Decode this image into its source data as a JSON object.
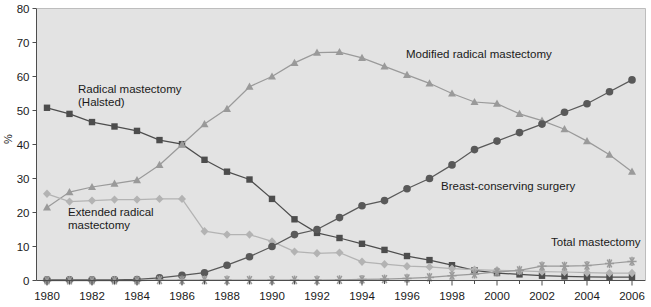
{
  "chart_data": {
    "type": "line",
    "title": "",
    "subtitle": "",
    "xlabel": "",
    "ylabel": "%",
    "xlim": [
      1980,
      2006
    ],
    "ylim": [
      0,
      80
    ],
    "ytick_step": 10,
    "yticks": [
      0,
      10,
      20,
      30,
      40,
      50,
      60,
      70,
      80
    ],
    "xticks": [
      1980,
      1982,
      1984,
      1986,
      1988,
      1990,
      1992,
      1994,
      1996,
      1998,
      2000,
      2002,
      2004,
      2006
    ],
    "xtick_labels": [
      "1980",
      "1982",
      "1984",
      "1986",
      "1988",
      "1990",
      "1992",
      "1994",
      "1996",
      "1998",
      "2000",
      "2002",
      "2004",
      "2006"
    ],
    "ytick_labels": [
      "0",
      "10",
      "20",
      "30",
      "40",
      "50",
      "60",
      "70",
      "80"
    ],
    "x": [
      1980,
      1981,
      1982,
      1983,
      1984,
      1985,
      1986,
      1987,
      1988,
      1989,
      1990,
      1991,
      1992,
      1993,
      1994,
      1995,
      1996,
      1997,
      1998,
      1999,
      2000,
      2001,
      2002,
      2003,
      2004,
      2005,
      2006
    ],
    "grid": false,
    "legend_position": "inline-annotations",
    "plot_background": "#e3e3e3",
    "series": [
      {
        "name": "Radical mastectomy (Halsted)",
        "marker": "square",
        "color": "#4d4d4d",
        "label_text": "Radical mastectomy\n(Halsted)",
        "values": [
          50.8,
          49.0,
          46.6,
          45.3,
          44.0,
          41.3,
          40.1,
          35.5,
          32.0,
          29.7,
          24.0,
          18.0,
          14.0,
          12.5,
          10.8,
          9.0,
          7.2,
          6.0,
          4.5,
          3.0,
          2.2,
          1.8,
          1.4,
          1.2,
          1.1,
          1.0,
          1.0
        ]
      },
      {
        "name": "Modified radical mastectomy",
        "marker": "triangle",
        "color": "#9a9a9a",
        "label_text": "Modified radical mastectomy",
        "values": [
          21.5,
          26.0,
          27.5,
          28.5,
          29.5,
          34.0,
          40.0,
          46.0,
          50.5,
          57.0,
          60.0,
          64.0,
          67.0,
          67.2,
          65.5,
          63.0,
          60.5,
          58.0,
          55.0,
          52.5,
          52.0,
          49.0,
          47.0,
          44.5,
          41.0,
          37.0,
          32.0
        ]
      },
      {
        "name": "Extended radical mastectomy",
        "marker": "diamond",
        "color": "#b3b3b3",
        "label_text": "Extended radical\nmastectomy",
        "values": [
          25.5,
          23.2,
          23.5,
          23.8,
          23.8,
          24.0,
          24.0,
          14.5,
          13.5,
          13.5,
          11.5,
          8.5,
          8.0,
          8.2,
          5.5,
          4.8,
          4.2,
          4.0,
          3.5,
          3.2,
          3.0,
          2.8,
          2.6,
          2.5,
          2.3,
          2.2,
          2.2
        ]
      },
      {
        "name": "Breast-conserving surgery",
        "marker": "circle",
        "color": "#595959",
        "label_text": "Breast-conserving surgery",
        "values": [
          0.2,
          0.2,
          0.2,
          0.2,
          0.3,
          0.8,
          1.5,
          2.3,
          4.5,
          7.0,
          10.0,
          13.5,
          15.0,
          18.5,
          22.0,
          23.5,
          27.0,
          30.0,
          34.0,
          38.5,
          41.0,
          43.5,
          46.0,
          49.5,
          52.0,
          55.5,
          59.0
        ]
      },
      {
        "name": "Total mastectomy",
        "marker": "star",
        "color": "#9a9a9a",
        "label_text": "Total mastectomy",
        "values": [
          0.0,
          0.0,
          0.0,
          0.0,
          0.0,
          0.1,
          0.1,
          0.1,
          0.1,
          0.1,
          0.1,
          0.1,
          0.1,
          0.2,
          0.3,
          0.4,
          0.6,
          0.9,
          1.4,
          1.9,
          2.5,
          3.0,
          4.2,
          4.2,
          4.4,
          5.0,
          5.6
        ]
      }
    ],
    "annotations": [
      {
        "text": "Radical mastectomy",
        "x_px": 78,
        "y_px": 93
      },
      {
        "text": "(Halsted)",
        "x_px": 78,
        "y_px": 106
      },
      {
        "text": "Extended radical",
        "x_px": 68,
        "y_px": 216
      },
      {
        "text": "mastectomy",
        "x_px": 68,
        "y_px": 229
      },
      {
        "text": "Modified radical mastectomy",
        "x_px": 406,
        "y_px": 58
      },
      {
        "text": "Breast-conserving surgery",
        "x_px": 441,
        "y_px": 190
      },
      {
        "text": "Total mastectomy",
        "x_px": 551,
        "y_px": 246
      }
    ]
  }
}
